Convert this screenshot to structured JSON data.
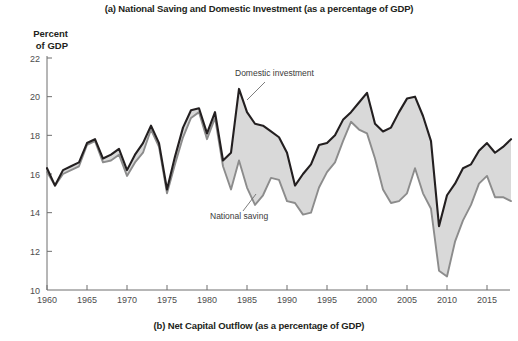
{
  "figure": {
    "panel_a_title": "(a) National Saving and Domestic Investment (as a percentage of GDP)",
    "panel_b_title": "(b) Net Capital Outflow (as a percentage of GDP)",
    "y_axis_title_line1": "Percent",
    "y_axis_title_line2": "of GDP",
    "annotation_investment": "Domestic investment",
    "annotation_saving": "National saving",
    "colors": {
      "investment_line": "#231f20",
      "saving_line": "#8c8c8c",
      "fill_band": "#d9d9d9",
      "axis": "#6f6f6f",
      "text": "#231f20"
    }
  },
  "chart_data": {
    "type": "line",
    "title": "(a) National Saving and Domestic Investment (as a percentage of GDP)",
    "subtitle": "(b) Net Capital Outflow (as a percentage of GDP)",
    "xlabel": "",
    "ylabel": "Percent of GDP",
    "xlim": [
      1960,
      2018
    ],
    "ylim": [
      10,
      22
    ],
    "ytick_values": [
      10,
      12,
      14,
      16,
      18,
      20,
      22
    ],
    "xtick_values": [
      1960,
      1965,
      1970,
      1975,
      1980,
      1985,
      1990,
      1995,
      2000,
      2005,
      2010,
      2015
    ],
    "grid": false,
    "legend_position": "inline-annotations",
    "annotations": [
      {
        "text": "Domestic investment",
        "series": "Domestic investment",
        "x": 1984
      },
      {
        "text": "National saving",
        "series": "National saving",
        "x": 1985
      }
    ],
    "x": [
      1960,
      1961,
      1962,
      1963,
      1964,
      1965,
      1966,
      1967,
      1968,
      1969,
      1970,
      1971,
      1972,
      1973,
      1974,
      1975,
      1976,
      1977,
      1978,
      1979,
      1980,
      1981,
      1982,
      1983,
      1984,
      1985,
      1986,
      1987,
      1988,
      1989,
      1990,
      1991,
      1992,
      1993,
      1994,
      1995,
      1996,
      1997,
      1998,
      1999,
      2000,
      2001,
      2002,
      2003,
      2004,
      2005,
      2006,
      2007,
      2008,
      2009,
      2010,
      2011,
      2012,
      2013,
      2014,
      2015,
      2016,
      2017,
      2018
    ],
    "series": [
      {
        "name": "Domestic investment",
        "color": "#231f20",
        "values": [
          16.3,
          15.4,
          16.2,
          16.4,
          16.6,
          17.6,
          17.8,
          16.8,
          17.0,
          17.3,
          16.2,
          17.0,
          17.6,
          18.5,
          17.6,
          15.2,
          16.9,
          18.4,
          19.3,
          19.4,
          18.1,
          19.2,
          16.7,
          17.1,
          20.4,
          19.2,
          18.6,
          18.5,
          18.2,
          17.9,
          17.1,
          15.4,
          16.0,
          16.5,
          17.5,
          17.6,
          18.0,
          18.8,
          19.2,
          19.7,
          20.2,
          18.6,
          18.2,
          18.4,
          19.2,
          19.9,
          20.0,
          19.0,
          17.7,
          13.3,
          14.9,
          15.5,
          16.3,
          16.5,
          17.2,
          17.6,
          17.1,
          17.4,
          17.8
        ]
      },
      {
        "name": "National saving",
        "color": "#8c8c8c",
        "values": [
          16.1,
          15.4,
          16.0,
          16.2,
          16.4,
          17.5,
          17.7,
          16.6,
          16.7,
          17.0,
          15.9,
          16.6,
          17.1,
          18.3,
          17.4,
          15.0,
          16.5,
          17.9,
          18.9,
          19.2,
          17.8,
          18.9,
          16.4,
          15.2,
          16.7,
          15.3,
          14.4,
          14.9,
          15.8,
          15.7,
          14.6,
          14.5,
          13.9,
          14.0,
          15.3,
          16.1,
          16.6,
          17.7,
          18.7,
          18.3,
          18.1,
          16.8,
          15.2,
          14.5,
          14.6,
          15.0,
          16.3,
          15.0,
          14.2,
          11.0,
          10.7,
          12.5,
          13.6,
          14.4,
          15.5,
          15.9,
          14.8,
          14.8,
          14.6
        ]
      }
    ]
  }
}
